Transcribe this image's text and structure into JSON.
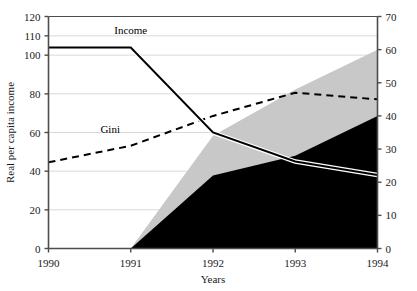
{
  "chart_data": {
    "type": "area",
    "title": "",
    "subtitle": "",
    "xlabel": "Years",
    "ylabel": "Real per capita income",
    "y2label": "",
    "x": [
      1990,
      1991,
      1992,
      1993,
      1994
    ],
    "x_tick_labels": [
      "1990",
      "1991",
      "1992",
      "1993",
      "1994"
    ],
    "xlim": [
      1990,
      1994
    ],
    "ylim": [
      0,
      120
    ],
    "y_tick_values": [
      0,
      20,
      40,
      60,
      80,
      100,
      110,
      120
    ],
    "y_tick_labels": [
      "0",
      "20",
      "40",
      "60",
      "80",
      "100",
      "110",
      "120"
    ],
    "y2lim": [
      0,
      70
    ],
    "y2_tick_values": [
      0,
      10,
      20,
      30,
      40,
      50,
      60,
      70
    ],
    "y2_tick_labels": [
      "0",
      "10",
      "20",
      "30",
      "40",
      "50",
      "60",
      "70"
    ],
    "grid": true,
    "grid_axis": "y",
    "legend_position": "inline-annotations",
    "series": [
      {
        "name": "Income",
        "label": "Income",
        "type": "line",
        "axis": "left",
        "style": "solid",
        "color": "#000000",
        "values": [
          104,
          104,
          60,
          45,
          38
        ]
      },
      {
        "name": "Gini",
        "label": "Gini",
        "type": "line",
        "axis": "right",
        "style": "dashed",
        "color": "#000000",
        "values": [
          26,
          31,
          40,
          47,
          45
        ]
      },
      {
        "name": "black-area",
        "label": "",
        "type": "area",
        "axis": "right",
        "stack": "bottom",
        "color": "#000000",
        "values": [
          0,
          0,
          22,
          28,
          40
        ]
      },
      {
        "name": "gray-area",
        "label": "",
        "type": "area",
        "axis": "right",
        "stack": "top",
        "color": "#c8c8c8",
        "values": [
          0,
          0,
          34,
          48,
          60
        ]
      }
    ],
    "annotations": [
      {
        "name": "income-label",
        "text": "Income",
        "x": 1991.0,
        "y_left": 111
      },
      {
        "name": "gini-label",
        "text": "Gini",
        "x": 1990.75,
        "y_right": 35
      }
    ]
  },
  "colors": {
    "axis": "#4d4d4d",
    "grid": "#d9d9d9",
    "line": "#000000",
    "area_dark": "#000000",
    "area_light": "#c8c8c8",
    "background": "#ffffff"
  }
}
